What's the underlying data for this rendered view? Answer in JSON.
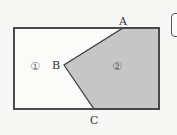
{
  "diagram": {
    "rectangle": {
      "x": 14,
      "y": 28,
      "width": 145,
      "height": 81,
      "stroke": "#444444",
      "fill": "#fbfbfa"
    },
    "shaded_region": {
      "label": "②",
      "fill": "#c6c6c6",
      "points": "123,28 159,28 159,109 94,109 64,65"
    },
    "unshaded_region": {
      "label": "①"
    },
    "vertices": [
      {
        "name": "A",
        "x": 123,
        "y": 28
      },
      {
        "name": "B",
        "x": 64,
        "y": 65
      },
      {
        "name": "C",
        "x": 94,
        "y": 109
      }
    ],
    "labels": {
      "A": "A",
      "B": "B",
      "C": "C",
      "region1": "①",
      "region2": "②"
    }
  }
}
